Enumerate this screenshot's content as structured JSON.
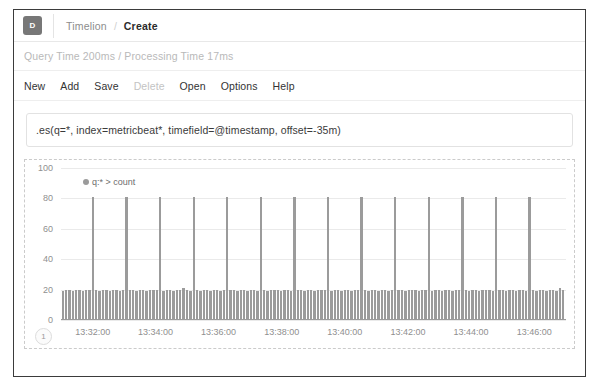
{
  "header": {
    "logo_letter": "D",
    "logo_icon": "app-logo-icon",
    "breadcrumb_root": "Timelion",
    "breadcrumb_separator": "/",
    "breadcrumb_current": "Create"
  },
  "status": {
    "text": "Query Time 200ms / Processing Time 17ms"
  },
  "menu": {
    "items": [
      {
        "label": "New",
        "disabled": false
      },
      {
        "label": "Add",
        "disabled": false
      },
      {
        "label": "Save",
        "disabled": false
      },
      {
        "label": "Delete",
        "disabled": true
      },
      {
        "label": "Open",
        "disabled": false
      },
      {
        "label": "Options",
        "disabled": false
      },
      {
        "label": "Help",
        "disabled": false
      }
    ]
  },
  "expression": {
    "value": ".es(q=*, index=metricbeat*, timefield=@timestamp, offset=-35m)",
    "placeholder": ".es(*)"
  },
  "chart_panel": {
    "series_badge": "1"
  },
  "chart_data": {
    "type": "bar",
    "title": "",
    "xlabel": "",
    "ylabel": "",
    "legend": [
      "q:* > count"
    ],
    "legend_position": "top-left",
    "legend_color": "#9b9b9b",
    "grid": true,
    "ylim": [
      0,
      100
    ],
    "yticks": [
      0,
      20,
      40,
      60,
      80,
      100
    ],
    "xticks": [
      "13:32:00",
      "13:34:00",
      "13:36:00",
      "13:38:00",
      "13:40:00",
      "13:42:00",
      "13:44:00",
      "13:46:00"
    ],
    "xtick_positions_pct": [
      6.3,
      18.7,
      31.2,
      43.7,
      56.2,
      68.7,
      81.2,
      93.7
    ],
    "x_range": [
      "13:31:00",
      "13:47:00"
    ],
    "bar_interval_seconds": 6,
    "baseline_value": 20,
    "spike_value": 81,
    "spike_period_bars": 10,
    "series": [
      {
        "name": "q:* > count",
        "color": "#9b9b9b",
        "values": [
          19,
          20,
          20,
          19,
          20,
          20,
          19,
          20,
          20,
          81,
          20,
          19,
          20,
          20,
          19,
          20,
          20,
          19,
          20,
          81,
          20,
          20,
          19,
          20,
          20,
          19,
          20,
          20,
          20,
          81,
          19,
          20,
          20,
          19,
          20,
          20,
          21,
          20,
          19,
          81,
          20,
          19,
          20,
          20,
          19,
          20,
          20,
          19,
          20,
          81,
          20,
          20,
          19,
          20,
          20,
          19,
          20,
          20,
          19,
          81,
          20,
          19,
          20,
          20,
          20,
          19,
          20,
          20,
          19,
          81,
          20,
          20,
          19,
          20,
          20,
          19,
          20,
          20,
          20,
          81,
          19,
          20,
          20,
          19,
          20,
          20,
          19,
          20,
          20,
          81,
          20,
          19,
          20,
          20,
          19,
          20,
          20,
          19,
          20,
          81,
          20,
          20,
          19,
          20,
          20,
          20,
          19,
          20,
          20,
          81,
          19,
          20,
          20,
          19,
          20,
          20,
          19,
          20,
          20,
          81,
          20,
          19,
          20,
          20,
          19,
          20,
          20,
          20,
          19,
          81,
          20,
          20,
          19,
          20,
          20,
          19,
          20,
          20,
          19,
          81,
          20,
          19,
          20,
          20,
          19,
          20,
          20,
          19,
          21,
          20
        ]
      }
    ]
  }
}
